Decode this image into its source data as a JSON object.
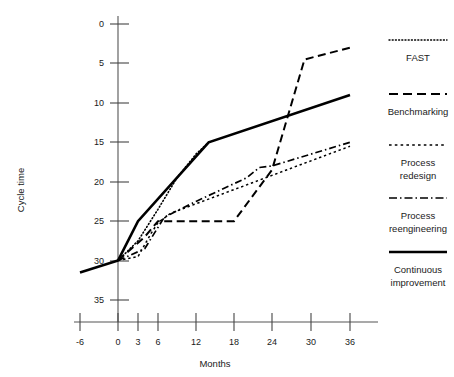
{
  "chart_data": {
    "type": "line",
    "title": "",
    "xlabel": "Months",
    "ylabel": "Cycle time",
    "grid": false,
    "y_inverted": true,
    "ylim": [
      0,
      37
    ],
    "xlim": [
      -9,
      39
    ],
    "legend_position": "right",
    "x_ticks": [
      -6,
      0,
      3,
      6,
      12,
      18,
      24,
      30,
      36
    ],
    "x_tick_labels": [
      "-6",
      "0",
      "3",
      "6",
      "12",
      "18",
      "24",
      "30",
      "36"
    ],
    "y_ticks": [
      0,
      5,
      10,
      15,
      20,
      25,
      30,
      35
    ],
    "y_tick_labels": [
      "0",
      "5",
      "10",
      "15",
      "20",
      "25",
      "30",
      "35"
    ],
    "baseline": {
      "name": "baseline",
      "style": "solid",
      "points": [
        [
          -6,
          31.5
        ],
        [
          0,
          30.0
        ]
      ]
    },
    "series": [
      {
        "name": "FAST",
        "style": "dotted",
        "label": "FAST",
        "points": [
          [
            0,
            30.0
          ],
          [
            3,
            27.5
          ],
          [
            6,
            23.5
          ],
          [
            9,
            19.5
          ],
          [
            12,
            16.5
          ],
          [
            14,
            15.0
          ]
        ]
      },
      {
        "name": "Benchmarking",
        "style": "dashed",
        "label": "Benchmarking",
        "points": [
          [
            0,
            30.0
          ],
          [
            4,
            27.0
          ],
          [
            6,
            25.0
          ],
          [
            18,
            25.0
          ],
          [
            24,
            18.5
          ],
          [
            29,
            4.5
          ],
          [
            36,
            3.0
          ]
        ]
      },
      {
        "name": "Process redesign",
        "style": "densely-dotted",
        "label": "Process redesign",
        "points": [
          [
            0,
            30.0
          ],
          [
            3,
            29.5
          ],
          [
            5,
            26.5
          ],
          [
            6,
            25.2
          ],
          [
            8,
            24.0
          ],
          [
            36,
            15.5
          ]
        ]
      },
      {
        "name": "Process reengineering",
        "style": "dashdot",
        "label": "Process reengineering",
        "points": [
          [
            0,
            30.0
          ],
          [
            4,
            28.5
          ],
          [
            7,
            24.5
          ],
          [
            12,
            22.5
          ],
          [
            20,
            19.5
          ],
          [
            22,
            18.2
          ],
          [
            24,
            18.0
          ],
          [
            36,
            15.0
          ]
        ]
      },
      {
        "name": "Continuous improvement",
        "style": "solid",
        "label": "Continuous improvement",
        "points": [
          [
            0,
            30.0
          ],
          [
            3,
            25.0
          ],
          [
            14,
            15.0
          ],
          [
            36,
            9.0
          ]
        ]
      }
    ],
    "legend_entries": [
      {
        "key": "fast",
        "label": "FAST",
        "style": "dotted"
      },
      {
        "key": "benchmarking",
        "label": "Benchmarking",
        "style": "dashed"
      },
      {
        "key": "process-redesign",
        "label": "Process\nredesign",
        "label_line1": "Process",
        "label_line2": "redesign",
        "style": "densely-dotted"
      },
      {
        "key": "process-reengineering",
        "label": "Process\nreengineering",
        "label_line1": "Process",
        "label_line2": "reengineering",
        "style": "dashdot"
      },
      {
        "key": "continuous-improvement",
        "label": "Continuous\nimprovement",
        "label_line1": "Continuous",
        "label_line2": "improvement",
        "style": "solid"
      }
    ],
    "colors": {
      "ink": "#000000",
      "axis": "#555555",
      "background": "#ffffff"
    }
  }
}
